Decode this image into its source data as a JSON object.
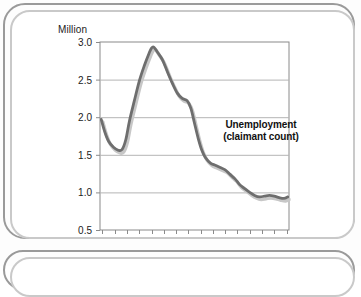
{
  "figure": {
    "unit_label": "Million",
    "annotation_line1": "Unemployment",
    "annotation_line2": "(claimant count)"
  },
  "colors": {
    "line": "#6e6e6e",
    "shadow": "#c7c7c7",
    "grid": "#b4b4b4",
    "axis": "#8a8a8a",
    "frame_outer": "#9a9a9a",
    "frame_inner": "#c9c9c9",
    "text": "#1b1b1b",
    "background": "#ffffff"
  },
  "chart_data": {
    "type": "line",
    "title": "Unemployment (claimant count)",
    "subtitle": "",
    "xlabel": "",
    "ylabel": "Million",
    "unit": "Million",
    "ylim": [
      0.5,
      3.0
    ],
    "yticks": [
      "0.5",
      "1.0",
      "1.5",
      "2.0",
      "2.5",
      "3.0"
    ],
    "ytick_values": [
      0.5,
      1.0,
      1.5,
      2.0,
      2.5,
      3.0
    ],
    "xlim": [
      1988.8,
      2004.2
    ],
    "xticks": [
      "89",
      "91",
      "93",
      "95",
      "97",
      "99",
      "01",
      "03"
    ],
    "xtick_values": [
      1989,
      1991,
      1993,
      1995,
      1997,
      1999,
      2001,
      2003
    ],
    "minor_xticks": [
      1989,
      1990,
      1991,
      1992,
      1993,
      1994,
      1995,
      1996,
      1997,
      1998,
      1999,
      2000,
      2001,
      2002,
      2003,
      2004
    ],
    "grid": "horizontal",
    "legend": "annotation-inline",
    "legend_position": "inside-right",
    "series": [
      {
        "name": "Unemployment (claimant count)",
        "color": "#6e6e6e",
        "x": [
          1988.9,
          1989.2,
          1989.5,
          1989.9,
          1990.3,
          1990.6,
          1990.9,
          1991.2,
          1991.6,
          1992.0,
          1992.4,
          1992.8,
          1993.0,
          1993.2,
          1993.5,
          1993.9,
          1994.3,
          1994.7,
          1995.1,
          1995.5,
          1995.9,
          1996.2,
          1996.5,
          1996.8,
          1997.1,
          1997.4,
          1997.8,
          1998.2,
          1998.6,
          1999.0,
          1999.4,
          1999.8,
          2000.2,
          2000.6,
          2001.0,
          2001.4,
          2001.8,
          2002.2,
          2002.6,
          2003.0,
          2003.4,
          2003.8,
          2004.1
        ],
        "values": [
          1.97,
          1.8,
          1.68,
          1.6,
          1.56,
          1.57,
          1.7,
          1.95,
          2.22,
          2.48,
          2.68,
          2.85,
          2.92,
          2.93,
          2.86,
          2.76,
          2.6,
          2.45,
          2.32,
          2.25,
          2.22,
          2.12,
          1.92,
          1.72,
          1.56,
          1.46,
          1.39,
          1.36,
          1.33,
          1.3,
          1.24,
          1.18,
          1.1,
          1.05,
          1.0,
          0.96,
          0.94,
          0.95,
          0.96,
          0.95,
          0.93,
          0.92,
          0.94
        ]
      }
    ]
  }
}
